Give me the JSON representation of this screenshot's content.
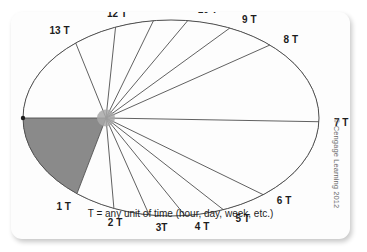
{
  "page": {
    "clipped_header_text": "",
    "credit": "© Cengage Learning 2012"
  },
  "figure": {
    "caption": "T = any unit of time (hour, day, week, etc.)",
    "colors": {
      "shaded_sector": "#8a8a8a",
      "open_sector": "#fdfdfd",
      "outline": "#4f4f4f",
      "hub": "#a8a8a8",
      "label_text": "#1d1d1d",
      "card_background": "#fdfdfd",
      "page_background": "#ffffff"
    }
  },
  "chart_data": {
    "type": "pie",
    "title": "",
    "subtitle": "",
    "xlabel": "",
    "ylabel": "",
    "annotations": [
      "T = any unit of time (hour, day, week, etc.)"
    ],
    "legend": [],
    "grid": false,
    "shape": "ellipse",
    "hub_offset_note": "rays originate from a hub placed left of the ellipse center",
    "unit_label": "T",
    "categories": [
      "0 T",
      "1 T",
      "2 T",
      "3T",
      "4 T",
      "5 T",
      "6 T",
      "7 T",
      "8 T",
      "9 T",
      "10 T",
      "11 T",
      "12 T",
      "13 T"
    ],
    "ray_labels": [
      {
        "label": "0 T",
        "angle_deg": 180,
        "marker_dot": true
      },
      {
        "label": "1 T",
        "angle_deg": 249,
        "marker_dot": false
      },
      {
        "label": "2 T",
        "angle_deg": 275,
        "marker_dot": false
      },
      {
        "label": "3T",
        "angle_deg": 294,
        "marker_dot": false
      },
      {
        "label": "4 T",
        "angle_deg": 309,
        "marker_dot": false
      },
      {
        "label": "5 T",
        "angle_deg": 322,
        "marker_dot": false
      },
      {
        "label": "6 T",
        "angle_deg": 334,
        "marker_dot": false
      },
      {
        "label": "7 T",
        "angle_deg": 359,
        "marker_dot": false
      },
      {
        "label": "8 T",
        "angle_deg": 24,
        "marker_dot": false
      },
      {
        "label": "9 T",
        "angle_deg": 36,
        "marker_dot": false
      },
      {
        "label": "10 T",
        "angle_deg": 50,
        "marker_dot": false
      },
      {
        "label": "11 T",
        "angle_deg": 64,
        "marker_dot": false
      },
      {
        "label": "12 T",
        "angle_deg": 84,
        "marker_dot": false
      },
      {
        "label": "13 T",
        "angle_deg": 112,
        "marker_dot": false
      }
    ],
    "sectors": [
      {
        "from": "0 T",
        "to": "13 T",
        "fill": "shaded"
      },
      {
        "from": "13 T",
        "to": "12 T",
        "fill": "open"
      },
      {
        "from": "12 T",
        "to": "11 T",
        "fill": "shaded"
      },
      {
        "from": "11 T",
        "to": "10 T",
        "fill": "open"
      },
      {
        "from": "10 T",
        "to": "9 T",
        "fill": "shaded"
      },
      {
        "from": "9 T",
        "to": "8 T",
        "fill": "open"
      },
      {
        "from": "8 T",
        "to": "7 T",
        "fill": "shaded"
      },
      {
        "from": "7 T",
        "to": "6 T",
        "fill": "open"
      },
      {
        "from": "6 T",
        "to": "5 T",
        "fill": "shaded"
      },
      {
        "from": "5 T",
        "to": "4 T",
        "fill": "open"
      },
      {
        "from": "4 T",
        "to": "3T",
        "fill": "shaded"
      },
      {
        "from": "3T",
        "to": "2 T",
        "fill": "open"
      },
      {
        "from": "2 T",
        "to": "1 T",
        "fill": "shaded"
      },
      {
        "from": "1 T",
        "to": "0 T",
        "fill": "open"
      }
    ]
  }
}
